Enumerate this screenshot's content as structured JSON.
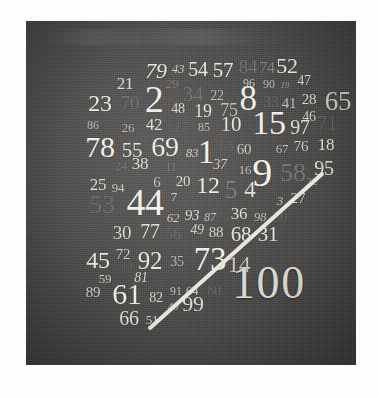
{
  "poster": {
    "title": "100 numbers poster",
    "panel_color": "#4a4a4a",
    "page_color": "#fdfdfc",
    "rule_color": "#e8e6e0",
    "hundred_label": "100",
    "hundred_color": "#d8d6d0"
  },
  "numbers": [
    {
      "t": "79",
      "x": 130,
      "y": 50,
      "s": 22,
      "c": "#ece9e2",
      "o": 0.98,
      "w": 400,
      "i": "italic"
    },
    {
      "t": "43",
      "x": 152,
      "y": 47,
      "s": 13,
      "c": "#d9d6cf",
      "o": 0.92,
      "w": 400,
      "i": "italic"
    },
    {
      "t": "54",
      "x": 172,
      "y": 48,
      "s": 20,
      "c": "#eeebe4",
      "o": 0.97,
      "w": 400,
      "i": "normal"
    },
    {
      "t": "57",
      "x": 197,
      "y": 49,
      "s": 21,
      "c": "#efece5",
      "o": 0.97,
      "w": 400,
      "i": "normal"
    },
    {
      "t": "84",
      "x": 222,
      "y": 45,
      "s": 19,
      "c": "#7e7d79",
      "o": 0.85,
      "w": 400,
      "i": "normal"
    },
    {
      "t": "74",
      "x": 241,
      "y": 47,
      "s": 16,
      "c": "#908e88",
      "o": 0.85,
      "w": 400,
      "i": "normal"
    },
    {
      "t": "52",
      "x": 261,
      "y": 45,
      "s": 22,
      "c": "#eceae3",
      "o": 0.97,
      "w": 400,
      "i": "normal"
    },
    {
      "t": "21",
      "x": 99,
      "y": 62,
      "s": 17,
      "c": "#e6e3dc",
      "o": 0.95,
      "w": 400,
      "i": "normal"
    },
    {
      "t": "29",
      "x": 146,
      "y": 62,
      "s": 13,
      "c": "#8e8c86",
      "o": 0.8,
      "w": 400,
      "i": "italic"
    },
    {
      "t": "96",
      "x": 223,
      "y": 62,
      "s": 12,
      "c": "#dedbd4",
      "o": 0.9,
      "w": 400,
      "i": "normal"
    },
    {
      "t": "90",
      "x": 243,
      "y": 63,
      "s": 12,
      "c": "#c9c6c0",
      "o": 0.88,
      "w": 400,
      "i": "normal"
    },
    {
      "t": "19",
      "x": 259,
      "y": 64,
      "s": 9,
      "c": "#b6b3ae",
      "o": 0.85,
      "w": 400,
      "i": "italic"
    },
    {
      "t": "47",
      "x": 278,
      "y": 60,
      "s": 14,
      "c": "#e3e0d9",
      "o": 0.93,
      "w": 400,
      "i": "normal"
    },
    {
      "t": "23",
      "x": 74,
      "y": 82,
      "s": 24,
      "c": "#f0ede6",
      "o": 0.98,
      "w": 400,
      "i": "normal"
    },
    {
      "t": "70",
      "x": 104,
      "y": 81,
      "s": 19,
      "c": "#7d7c78",
      "o": 0.8,
      "w": 400,
      "i": "normal"
    },
    {
      "t": "2",
      "x": 128,
      "y": 78,
      "s": 38,
      "c": "#f3f0e9",
      "o": 1.0,
      "w": 400,
      "i": "normal"
    },
    {
      "t": "34",
      "x": 167,
      "y": 73,
      "s": 21,
      "c": "#7d7b77",
      "o": 0.8,
      "w": 400,
      "i": "normal"
    },
    {
      "t": "22",
      "x": 191,
      "y": 75,
      "s": 14,
      "c": "#c8c5bf",
      "o": 0.9,
      "w": 400,
      "i": "normal"
    },
    {
      "t": "8",
      "x": 222,
      "y": 77,
      "s": 35,
      "c": "#f1eee7",
      "o": 1.0,
      "w": 400,
      "i": "normal"
    },
    {
      "t": "33",
      "x": 245,
      "y": 81,
      "s": 16,
      "c": "#6f6e6a",
      "o": 0.78,
      "w": 400,
      "i": "normal"
    },
    {
      "t": "41",
      "x": 263,
      "y": 82,
      "s": 15,
      "c": "#cfccc6",
      "o": 0.9,
      "w": 400,
      "i": "normal"
    },
    {
      "t": "28",
      "x": 283,
      "y": 78,
      "s": 15,
      "c": "#e4e1da",
      "o": 0.94,
      "w": 400,
      "i": "normal"
    },
    {
      "t": "65",
      "x": 312,
      "y": 80,
      "s": 27,
      "c": "#d8d5ce",
      "o": 0.95,
      "w": 400,
      "i": "normal"
    },
    {
      "t": "48",
      "x": 152,
      "y": 88,
      "s": 14,
      "c": "#e1ded7",
      "o": 0.93,
      "w": 400,
      "i": "normal"
    },
    {
      "t": "19",
      "x": 177,
      "y": 90,
      "s": 18,
      "c": "#ebe8e1",
      "o": 0.96,
      "w": 400,
      "i": "normal"
    },
    {
      "t": "75",
      "x": 203,
      "y": 89,
      "s": 18,
      "c": "#cac7c1",
      "o": 0.9,
      "w": 400,
      "i": "normal"
    },
    {
      "t": "46",
      "x": 283,
      "y": 96,
      "s": 14,
      "c": "#dcd9d2",
      "o": 0.92,
      "w": 400,
      "i": "normal"
    },
    {
      "t": "86",
      "x": 67,
      "y": 104,
      "s": 12,
      "c": "#cbc8c2",
      "o": 0.9,
      "w": 400,
      "i": "normal"
    },
    {
      "t": "26",
      "x": 102,
      "y": 106,
      "s": 13,
      "c": "#c3c0ba",
      "o": 0.9,
      "w": 400,
      "i": "normal"
    },
    {
      "t": "42",
      "x": 128,
      "y": 103,
      "s": 17,
      "c": "#e9e6df",
      "o": 0.95,
      "w": 400,
      "i": "normal"
    },
    {
      "t": "17",
      "x": 155,
      "y": 107,
      "s": 14,
      "c": "#74736f",
      "o": 0.78,
      "w": 400,
      "i": "italic"
    },
    {
      "t": "85",
      "x": 178,
      "y": 106,
      "s": 12,
      "c": "#cfccc6",
      "o": 0.9,
      "w": 400,
      "i": "normal"
    },
    {
      "t": "10",
      "x": 205,
      "y": 103,
      "s": 21,
      "c": "#edeae3",
      "o": 0.97,
      "w": 400,
      "i": "normal"
    },
    {
      "t": "15",
      "x": 243,
      "y": 102,
      "s": 34,
      "c": "#f1eee7",
      "o": 1.0,
      "w": 400,
      "i": "normal"
    },
    {
      "t": "97",
      "x": 274,
      "y": 106,
      "s": 20,
      "c": "#e8e5de",
      "o": 0.95,
      "w": 400,
      "i": "normal"
    },
    {
      "t": "71",
      "x": 301,
      "y": 102,
      "s": 21,
      "c": "#6d6c68",
      "o": 0.78,
      "w": 400,
      "i": "normal"
    },
    {
      "t": "78",
      "x": 74,
      "y": 126,
      "s": 30,
      "c": "#f2efe8",
      "o": 1.0,
      "w": 400,
      "i": "normal"
    },
    {
      "t": "55",
      "x": 106,
      "y": 129,
      "s": 21,
      "c": "#ebe8e1",
      "o": 0.96,
      "w": 400,
      "i": "normal"
    },
    {
      "t": "69",
      "x": 139,
      "y": 126,
      "s": 28,
      "c": "#f0ede6",
      "o": 0.99,
      "w": 400,
      "i": "normal"
    },
    {
      "t": "83",
      "x": 166,
      "y": 131,
      "s": 13,
      "c": "#ddd9d3",
      "o": 0.92,
      "w": 400,
      "i": "italic"
    },
    {
      "t": "1",
      "x": 180,
      "y": 131,
      "s": 34,
      "c": "#f2efe8",
      "o": 1.0,
      "w": 400,
      "i": "normal"
    },
    {
      "t": "63",
      "x": 200,
      "y": 125,
      "s": 15,
      "c": "#6d6c68",
      "o": 0.78,
      "w": 400,
      "i": "normal"
    },
    {
      "t": "60",
      "x": 218,
      "y": 128,
      "s": 15,
      "c": "#dbd8d1",
      "o": 0.92,
      "w": 400,
      "i": "normal"
    },
    {
      "t": "67",
      "x": 256,
      "y": 127,
      "s": 13,
      "c": "#ccc9c3",
      "o": 0.9,
      "w": 400,
      "i": "normal"
    },
    {
      "t": "76",
      "x": 275,
      "y": 125,
      "s": 15,
      "c": "#d6d3cc",
      "o": 0.92,
      "w": 400,
      "i": "normal"
    },
    {
      "t": "18",
      "x": 300,
      "y": 123,
      "s": 17,
      "c": "#ebe8e1",
      "o": 0.96,
      "w": 400,
      "i": "normal"
    },
    {
      "t": "24",
      "x": 95,
      "y": 144,
      "s": 13,
      "c": "#7b7a76",
      "o": 0.78,
      "w": 400,
      "i": "normal"
    },
    {
      "t": "38",
      "x": 114,
      "y": 142,
      "s": 17,
      "c": "#e8e5de",
      "o": 0.95,
      "w": 400,
      "i": "normal"
    },
    {
      "t": "11",
      "x": 145,
      "y": 146,
      "s": 12,
      "c": "#8b8984",
      "o": 0.82,
      "w": 400,
      "i": "normal"
    },
    {
      "t": "37",
      "x": 194,
      "y": 144,
      "s": 14,
      "c": "#ddd9d3",
      "o": 0.92,
      "w": 400,
      "i": "italic"
    },
    {
      "t": "16",
      "x": 219,
      "y": 148,
      "s": 13,
      "c": "#d2cfc9",
      "o": 0.9,
      "w": 400,
      "i": "normal"
    },
    {
      "t": "9",
      "x": 236,
      "y": 152,
      "s": 40,
      "c": "#f3f0e9",
      "o": 1.0,
      "w": 400,
      "i": "normal"
    },
    {
      "t": "58",
      "x": 267,
      "y": 152,
      "s": 26,
      "c": "#807f7b",
      "o": 0.82,
      "w": 400,
      "i": "normal"
    },
    {
      "t": "95",
      "x": 298,
      "y": 147,
      "s": 20,
      "c": "#e6e3dc",
      "o": 0.95,
      "w": 400,
      "i": "normal"
    },
    {
      "t": "32",
      "x": 286,
      "y": 160,
      "s": 11,
      "c": "#aaa8a3",
      "o": 0.86,
      "w": 400,
      "i": "normal"
    },
    {
      "t": "25",
      "x": 72,
      "y": 163,
      "s": 17,
      "c": "#e7e4dd",
      "o": 0.95,
      "w": 400,
      "i": "normal"
    },
    {
      "t": "94",
      "x": 92,
      "y": 166,
      "s": 13,
      "c": "#d6d3cc",
      "o": 0.92,
      "w": 400,
      "i": "normal"
    },
    {
      "t": "6",
      "x": 131,
      "y": 161,
      "s": 15,
      "c": "#cfccc6",
      "o": 0.9,
      "w": 400,
      "i": "normal"
    },
    {
      "t": "20",
      "x": 157,
      "y": 160,
      "s": 15,
      "c": "#e6e3dc",
      "o": 0.94,
      "w": 400,
      "i": "normal"
    },
    {
      "t": "12",
      "x": 182,
      "y": 164,
      "s": 24,
      "c": "#efece5",
      "o": 0.98,
      "w": 400,
      "i": "normal"
    },
    {
      "t": "5",
      "x": 205,
      "y": 168,
      "s": 25,
      "c": "#84837f",
      "o": 0.84,
      "w": 400,
      "i": "normal"
    },
    {
      "t": "4",
      "x": 224,
      "y": 168,
      "s": 23,
      "c": "#e9e6df",
      "o": 0.96,
      "w": 400,
      "i": "normal"
    },
    {
      "t": "53",
      "x": 76,
      "y": 184,
      "s": 26,
      "c": "#767571",
      "o": 0.8,
      "w": 400,
      "i": "normal"
    },
    {
      "t": "44",
      "x": 119,
      "y": 181,
      "s": 38,
      "c": "#f3f0e9",
      "o": 1.0,
      "w": 400,
      "i": "normal"
    },
    {
      "t": "7",
      "x": 148,
      "y": 175,
      "s": 13,
      "c": "#dddad3",
      "o": 0.92,
      "w": 400,
      "i": "normal"
    },
    {
      "t": "3",
      "x": 254,
      "y": 179,
      "s": 13,
      "c": "#cfccc6",
      "o": 0.9,
      "w": 400,
      "i": "italic"
    },
    {
      "t": "27",
      "x": 272,
      "y": 177,
      "s": 15,
      "c": "#dddad3",
      "o": 0.92,
      "w": 400,
      "i": "normal"
    },
    {
      "t": "62",
      "x": 147,
      "y": 196,
      "s": 13,
      "c": "#ddd9d3",
      "o": 0.92,
      "w": 400,
      "i": "italic"
    },
    {
      "t": "93",
      "x": 166,
      "y": 194,
      "s": 15,
      "c": "#e5e2db",
      "o": 0.94,
      "w": 400,
      "i": "italic"
    },
    {
      "t": "87",
      "x": 184,
      "y": 196,
      "s": 12,
      "c": "#d3d0ca",
      "o": 0.9,
      "w": 400,
      "i": "italic"
    },
    {
      "t": "36",
      "x": 213,
      "y": 192,
      "s": 17,
      "c": "#e6e3dc",
      "o": 0.94,
      "w": 400,
      "i": "normal"
    },
    {
      "t": "98",
      "x": 234,
      "y": 195,
      "s": 13,
      "c": "#c7c4be",
      "o": 0.9,
      "w": 400,
      "i": "italic"
    },
    {
      "t": "50",
      "x": 254,
      "y": 196,
      "s": 15,
      "c": "#6b6a66",
      "o": 0.76,
      "w": 400,
      "i": "normal"
    },
    {
      "t": "30",
      "x": 96,
      "y": 211,
      "s": 19,
      "c": "#e1ded7",
      "o": 0.94,
      "w": 400,
      "i": "normal"
    },
    {
      "t": "77",
      "x": 124,
      "y": 210,
      "s": 20,
      "c": "#eae7e0",
      "o": 0.96,
      "w": 400,
      "i": "normal"
    },
    {
      "t": "56",
      "x": 147,
      "y": 213,
      "s": 16,
      "c": "#74736f",
      "o": 0.78,
      "w": 400,
      "i": "normal"
    },
    {
      "t": "49",
      "x": 171,
      "y": 209,
      "s": 14,
      "c": "#dad7d0",
      "o": 0.92,
      "w": 400,
      "i": "italic"
    },
    {
      "t": "88",
      "x": 190,
      "y": 211,
      "s": 15,
      "c": "#e0ddd6",
      "o": 0.93,
      "w": 400,
      "i": "normal"
    },
    {
      "t": "68",
      "x": 215,
      "y": 213,
      "s": 21,
      "c": "#ebe8e1",
      "o": 0.96,
      "w": 400,
      "i": "normal"
    },
    {
      "t": "31",
      "x": 242,
      "y": 213,
      "s": 21,
      "c": "#eae7e0",
      "o": 0.96,
      "w": 400,
      "i": "normal"
    },
    {
      "t": "45",
      "x": 72,
      "y": 239,
      "s": 24,
      "c": "#eeebe4",
      "o": 0.97,
      "w": 400,
      "i": "normal"
    },
    {
      "t": "72",
      "x": 97,
      "y": 233,
      "s": 15,
      "c": "#dddad3",
      "o": 0.92,
      "w": 400,
      "i": "normal"
    },
    {
      "t": "10",
      "x": 101,
      "y": 244,
      "s": 11,
      "c": "#6f6e6a",
      "o": 0.72,
      "w": 400,
      "i": "normal"
    },
    {
      "t": "92",
      "x": 124,
      "y": 239,
      "s": 25,
      "c": "#efece5",
      "o": 0.97,
      "w": 400,
      "i": "normal"
    },
    {
      "t": "35",
      "x": 151,
      "y": 241,
      "s": 14,
      "c": "#cac7c1",
      "o": 0.9,
      "w": 400,
      "i": "normal"
    },
    {
      "t": "73",
      "x": 184,
      "y": 238,
      "s": 33,
      "c": "#f1eee7",
      "o": 1.0,
      "w": 400,
      "i": "normal"
    },
    {
      "t": "14",
      "x": 213,
      "y": 243,
      "s": 23,
      "c": "#d1cec8",
      "o": 0.92,
      "w": 400,
      "i": "normal"
    },
    {
      "t": "59",
      "x": 79,
      "y": 257,
      "s": 13,
      "c": "#d8d5ce",
      "o": 0.92,
      "w": 400,
      "i": "normal"
    },
    {
      "t": "81",
      "x": 115,
      "y": 257,
      "s": 14,
      "c": "#e1ded7",
      "o": 0.93,
      "w": 400,
      "i": "italic"
    },
    {
      "t": "89",
      "x": 67,
      "y": 271,
      "s": 15,
      "c": "#dddad3",
      "o": 0.92,
      "w": 400,
      "i": "normal"
    },
    {
      "t": "61",
      "x": 101,
      "y": 273,
      "s": 30,
      "c": "#f0ede6",
      "o": 0.99,
      "w": 400,
      "i": "normal"
    },
    {
      "t": "82",
      "x": 130,
      "y": 277,
      "s": 14,
      "c": "#e1ded7",
      "o": 0.93,
      "w": 400,
      "i": "normal"
    },
    {
      "t": "91",
      "x": 150,
      "y": 270,
      "s": 12,
      "c": "#d3d0ca",
      "o": 0.9,
      "w": 400,
      "i": "normal"
    },
    {
      "t": "64",
      "x": 166,
      "y": 269,
      "s": 13,
      "c": "#d3d0ca",
      "o": 0.9,
      "w": 400,
      "i": "normal"
    },
    {
      "t": "80",
      "x": 188,
      "y": 270,
      "s": 14,
      "c": "#6f6e6a",
      "o": 0.74,
      "w": 400,
      "i": "normal"
    },
    {
      "t": "40",
      "x": 147,
      "y": 285,
      "s": 11,
      "c": "#c6c3bd",
      "o": 0.88,
      "w": 400,
      "i": "italic"
    },
    {
      "t": "99",
      "x": 167,
      "y": 283,
      "s": 22,
      "c": "#e5e2db",
      "o": 0.94,
      "w": 400,
      "i": "normal"
    },
    {
      "t": "66",
      "x": 103,
      "y": 297,
      "s": 20,
      "c": "#e9e6df",
      "o": 0.95,
      "w": 400,
      "i": "normal"
    },
    {
      "t": "51",
      "x": 126,
      "y": 298,
      "s": 13,
      "c": "#dddad3",
      "o": 0.92,
      "w": 400,
      "i": "normal"
    }
  ],
  "diagonal": {
    "x1": 124,
    "y1": 307,
    "x2": 296,
    "y2": 153,
    "stroke_width": 4,
    "color": "#e8e6e0"
  }
}
